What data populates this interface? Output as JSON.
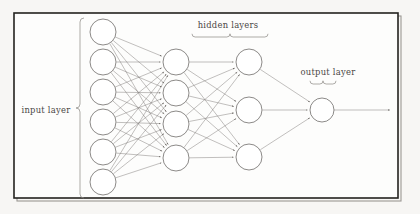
{
  "figure": {
    "background_color": "#f7f6f4",
    "panel_color": "#fdfdfc",
    "frame_color": "#24221f",
    "node_stroke_color": "#6f6c69",
    "edge_color": "#77736f",
    "text_color": "#4a4745",
    "labels": {
      "input": "input layer",
      "hidden": "hidden layers",
      "output": "output layer"
    }
  },
  "chart_data": {
    "type": "diagram",
    "layers": [
      {
        "name": "input layer",
        "label": "input layer",
        "node_count": 6,
        "x": 103,
        "radius": 13,
        "node_y": [
          32,
          62,
          92,
          122,
          152,
          182
        ],
        "brace_side": "right",
        "label_x": 46,
        "label_y": 110
      },
      {
        "name": "hidden layer 1",
        "label": "hidden layers",
        "node_count": 4,
        "x": 176,
        "radius": 13,
        "node_y": [
          62,
          93,
          124,
          158
        ],
        "brace_side": "top",
        "label_x": 228,
        "label_y": 28
      },
      {
        "name": "hidden layer 2",
        "label": "hidden layers",
        "node_count": 3,
        "x": 249,
        "radius": 13,
        "node_y": [
          62,
          110,
          157
        ],
        "brace_side": "top",
        "label_x": 228,
        "label_y": 28
      },
      {
        "name": "output layer",
        "label": "output layer",
        "node_count": 1,
        "x": 322,
        "radius": 12,
        "node_y": [
          110
        ],
        "brace_side": "top",
        "label_x": 328,
        "label_y": 74
      }
    ],
    "connections": [
      {
        "from": "input layer",
        "to": "hidden layer 1",
        "style": "fully-connected",
        "arrowheads": true
      },
      {
        "from": "hidden layer 1",
        "to": "hidden layer 2",
        "style": "fully-connected",
        "arrowheads": true
      },
      {
        "from": "hidden layer 2",
        "to": "output layer",
        "style": "fully-connected",
        "arrowheads": true
      }
    ],
    "output_arrow": {
      "from_x": 334,
      "to_x": 390,
      "y": 110,
      "arrowhead": true
    },
    "braces": [
      {
        "for": "input layer",
        "orientation": "vertical",
        "x": 80,
        "y_start": 18,
        "y_end": 198
      },
      {
        "for": "hidden layers",
        "orientation": "horizontal",
        "y": 37,
        "x_start": 192,
        "x_end": 268
      },
      {
        "for": "output layer",
        "orientation": "horizontal",
        "y": 84,
        "x_start": 310,
        "x_end": 336
      }
    ],
    "frame": {
      "x": 14,
      "y": 13,
      "width": 384,
      "height": 185
    },
    "grid": false,
    "legend": "none"
  }
}
